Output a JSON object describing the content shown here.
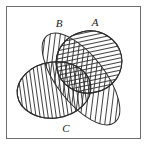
{
  "figure": {
    "type": "venn-diagram",
    "background_color": "#ffffff",
    "frame": {
      "name": "figure-border",
      "x": 6,
      "y": 6,
      "width": 135,
      "height": 133,
      "stroke_color": "#6e6e6e",
      "stroke_width": 1,
      "fill": "none"
    },
    "stroke_color": "#2b2b2b",
    "hatch_color": "#2b2b2b",
    "sets": [
      {
        "id": "A",
        "label": "A",
        "hatch": "horizontal",
        "label_x": 95,
        "label_y": 26,
        "cx": 89,
        "cy": 62,
        "rx": 33,
        "ry": 31,
        "rotate": -12
      },
      {
        "id": "B",
        "label": "B",
        "hatch": "diagonal-up",
        "label_x": 59,
        "label_y": 27,
        "cx": 81,
        "cy": 79,
        "rx": 55,
        "ry": 24,
        "rotate": 52
      },
      {
        "id": "C",
        "label": "C",
        "hatch": "vertical",
        "label_x": 66,
        "label_y": 132,
        "cx": 54,
        "cy": 90,
        "rx": 37,
        "ry": 28,
        "rotate": -8
      }
    ]
  }
}
